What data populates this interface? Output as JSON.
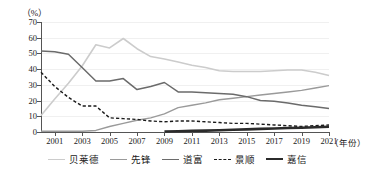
{
  "chart_data": {
    "type": "line",
    "title": "",
    "subtitle": "",
    "xlabel": "年份",
    "ylabel": "%",
    "ylim": [
      0,
      70
    ],
    "xlim": [
      2000,
      2021
    ],
    "grid": true,
    "legend_position": "bottom",
    "yticks": [
      0,
      10,
      20,
      30,
      40,
      50,
      60,
      70
    ],
    "xticks": [
      2001,
      2003,
      2005,
      2007,
      2009,
      2011,
      2013,
      2015,
      2017,
      2019,
      2021
    ],
    "x": [
      2000,
      2001,
      2002,
      2003,
      2004,
      2005,
      2006,
      2007,
      2008,
      2009,
      2010,
      2011,
      2012,
      2013,
      2014,
      2015,
      2016,
      2017,
      2018,
      2019,
      2020,
      2021
    ],
    "series": [
      {
        "name": "贝莱德",
        "color": "#cccccc",
        "style": "solid",
        "width": 1.6,
        "values": [
          10.5,
          21,
          31,
          42,
          55.5,
          53.5,
          59.5,
          53,
          48,
          46.5,
          44.5,
          42.5,
          41,
          39,
          38.5,
          38.5,
          38.5,
          39,
          39.5,
          39.5,
          38,
          36
        ]
      },
      {
        "name": "先锋",
        "color": "#9a9a9a",
        "style": "solid",
        "width": 1.4,
        "values": [
          0.5,
          0.5,
          0.5,
          0.5,
          1,
          3.5,
          5.5,
          7.5,
          9,
          11.5,
          15.5,
          17,
          18.5,
          20.5,
          21.5,
          22.5,
          23.5,
          24.5,
          25.5,
          26.5,
          28,
          29.5
        ]
      },
      {
        "name": "道富",
        "color": "#6b6b6b",
        "style": "solid",
        "width": 1.5,
        "values": [
          51.5,
          51,
          49.5,
          41,
          32.5,
          32.5,
          34,
          27,
          29,
          31.5,
          25.5,
          25.5,
          25,
          24.5,
          24,
          22.5,
          20,
          19.5,
          18.5,
          17,
          16,
          15
        ]
      },
      {
        "name": "景顺",
        "color": "#1a1a1a",
        "style": "dashed",
        "width": 1.4,
        "values": [
          38,
          29,
          22,
          16.5,
          16.5,
          9,
          8.5,
          8,
          7,
          6.5,
          7,
          7,
          6.5,
          6,
          5.5,
          5.5,
          5,
          4.5,
          4,
          3.5,
          4,
          4.5
        ]
      },
      {
        "name": "嘉信",
        "color": "#2b2b2b",
        "style": "solid",
        "width": 2.6,
        "values": [
          null,
          null,
          null,
          null,
          null,
          null,
          null,
          null,
          null,
          0.3,
          0.5,
          0.7,
          0.9,
          1.1,
          1.4,
          1.7,
          2.0,
          2.2,
          2.5,
          2.7,
          3.0,
          3.3
        ]
      }
    ]
  },
  "axis": {
    "unit_label": "（%）",
    "x_title": "（年份）"
  },
  "legend": {
    "items": [
      {
        "label": "贝莱德"
      },
      {
        "label": "先锋"
      },
      {
        "label": "道富"
      },
      {
        "label": "景顺"
      },
      {
        "label": "嘉信"
      }
    ]
  }
}
